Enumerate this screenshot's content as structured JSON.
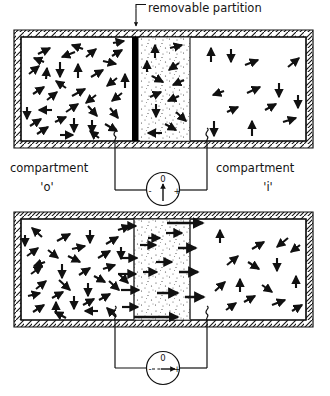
{
  "figure": {
    "title_note": "removable partition",
    "annotation_label": "removable partition",
    "compartment_left_name": "compartment",
    "compartment_left_id": "'o'",
    "compartment_right_name": "compartment",
    "compartment_right_id": "'i'",
    "colors": {
      "ink": "#111111",
      "partition": "#000000",
      "stipple": "#2b2b2b",
      "wall_hatch": "#111111",
      "background": "#ffffff"
    }
  },
  "panels": [
    {
      "id": "panel-top",
      "state_label": "partition in place",
      "partition_present": true,
      "partition_color": "#000000",
      "meter": {
        "name": "voltmeter",
        "zero_label": "0",
        "minus_label": "-",
        "plus_label": "+",
        "needle_direction": "up",
        "reading": "0",
        "needle_dashed": false
      },
      "left_compartment": {
        "label": "compartment",
        "id": "'o'",
        "particle_density": "high",
        "arrow_count": 34,
        "arrow_orientation": "random"
      },
      "right_compartment": {
        "label": "compartment",
        "id": "'i'",
        "particle_density": "low",
        "arrow_count": 13,
        "arrow_orientation": "random"
      },
      "stipple_region": {
        "label": "diffusion layer",
        "arrow_count": 12,
        "arrow_orientation": "random"
      },
      "electrodes": [
        {
          "id": "electrode-left",
          "x": 115
        },
        {
          "id": "electrode-right",
          "x": 207
        }
      ]
    },
    {
      "id": "panel-bottom",
      "state_label": "partition removed",
      "partition_present": false,
      "meter": {
        "name": "voltmeter",
        "zero_label": "0",
        "minus_label": "-",
        "plus_label": "+",
        "needle_direction": "right",
        "reading": "positive deflection",
        "needle_dashed": true
      },
      "left_compartment": {
        "label": "compartment",
        "id": "'o'",
        "particle_density": "high",
        "arrow_count": 33,
        "arrow_orientation": "random"
      },
      "right_compartment": {
        "label": "compartment",
        "id": "'i'",
        "particle_density": "low",
        "arrow_count": 15,
        "arrow_orientation": "random"
      },
      "stipple_region": {
        "label": "diffusion layer",
        "arrow_count": 16,
        "arrow_orientation": "rightward",
        "net_flux_direction": "left-to-right"
      },
      "electrodes": [
        {
          "id": "electrode-left",
          "x": 115
        },
        {
          "id": "electrode-right",
          "x": 207
        }
      ]
    }
  ],
  "geometry": {
    "top_box": {
      "x": 14,
      "y": 30,
      "w": 299,
      "h": 118,
      "wall": 7
    },
    "bottom_box": {
      "x": 14,
      "y": 212,
      "w": 299,
      "h": 115,
      "wall": 7
    },
    "partition_x": 132,
    "partition_w": 6,
    "stipple_x0": 140,
    "stipple_x1": 190
  }
}
